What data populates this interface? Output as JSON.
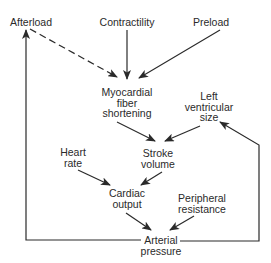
{
  "diagram": {
    "nodes": {
      "afterload": {
        "line1": "Afterload"
      },
      "contractility": {
        "line1": "Contractility"
      },
      "preload": {
        "line1": "Preload"
      },
      "myocardial": {
        "line1": "Myocardial",
        "line2": "fiber",
        "line3": "shortening"
      },
      "lvsize": {
        "line1": "Left",
        "line2": "ventricular",
        "line3": "size"
      },
      "heartrate": {
        "line1": "Heart",
        "line2": "rate"
      },
      "stroke": {
        "line1": "Stroke",
        "line2": "volume"
      },
      "cardiac": {
        "line1": "Cardiac",
        "line2": "output"
      },
      "peripheral": {
        "line1": "Peripheral",
        "line2": "resistance"
      },
      "arterial": {
        "line1": "Arterial",
        "line2": "pressure"
      }
    },
    "edges": [
      {
        "from": "Afterload",
        "to": "Myocardial fiber shortening",
        "style": "dashed"
      },
      {
        "from": "Contractility",
        "to": "Myocardial fiber shortening",
        "style": "solid"
      },
      {
        "from": "Preload",
        "to": "Myocardial fiber shortening",
        "style": "solid"
      },
      {
        "from": "Myocardial fiber shortening",
        "to": "Stroke volume",
        "style": "solid"
      },
      {
        "from": "Left ventricular size",
        "to": "Stroke volume",
        "style": "solid"
      },
      {
        "from": "Heart rate",
        "to": "Cardiac output",
        "style": "solid"
      },
      {
        "from": "Stroke volume",
        "to": "Cardiac output",
        "style": "solid"
      },
      {
        "from": "Cardiac output",
        "to": "Arterial pressure",
        "style": "solid"
      },
      {
        "from": "Peripheral resistance",
        "to": "Arterial pressure",
        "style": "solid"
      },
      {
        "from": "Arterial pressure",
        "to": "Afterload",
        "style": "solid"
      },
      {
        "from": "Arterial pressure",
        "to": "Left ventricular size",
        "style": "solid"
      }
    ],
    "colors": {
      "line": "#2a2a2a",
      "background": "#ffffff"
    }
  }
}
